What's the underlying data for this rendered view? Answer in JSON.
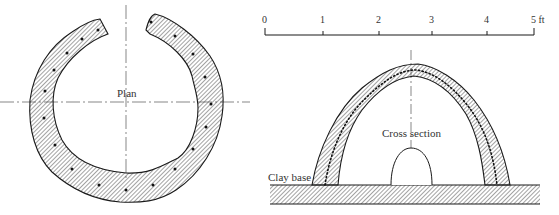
{
  "plan_view": {
    "label": "Plan"
  },
  "cross_section_view": {
    "label": "Cross section",
    "base_label": "Clay base"
  },
  "scale_bar": {
    "ticks": [
      "0",
      "1",
      "2",
      "3",
      "4",
      "5 ft"
    ],
    "unit": "ft"
  },
  "colors": {
    "line": "#1a1a1a",
    "hatch": "#333333",
    "text": "#333333",
    "background": "#ffffff"
  }
}
